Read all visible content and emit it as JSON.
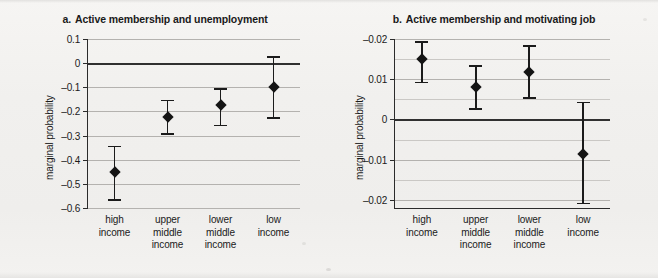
{
  "figure": {
    "background_color": "#f2f1ef",
    "marker_color": "#141414",
    "gridline_color": "#b4b2af",
    "zero_line_color": "#303030"
  },
  "panels": [
    {
      "id": "a",
      "label": "a.",
      "title": "Active membership and unemployment",
      "ylabel": "marginal probability"
    },
    {
      "id": "b",
      "label": "b.",
      "title": "Active membership and motivating job",
      "ylabel": "marginal probability"
    }
  ],
  "chart_data": [
    {
      "type": "scatter",
      "panel": "a",
      "title": "a.  Active membership and unemployment",
      "xlabel": "",
      "ylabel": "marginal probability",
      "ylim": [
        -0.6,
        0.1
      ],
      "ytick_labels": [
        "0.1",
        "0",
        "–0.1",
        "–0.2",
        "–0.3",
        "–0.4",
        "–0.5",
        "–0.6"
      ],
      "ytick_values": [
        0.1,
        0,
        -0.1,
        -0.2,
        -0.3,
        -0.4,
        -0.5,
        -0.6
      ],
      "grid": true,
      "zero_line": 0,
      "legend": "none",
      "categories": [
        "high income",
        "upper middle income",
        "lower middle income",
        "low income"
      ],
      "categories_wrapped": [
        [
          "high",
          "income"
        ],
        [
          "upper",
          "middle",
          "income"
        ],
        [
          "lower",
          "middle",
          "income"
        ],
        [
          "low",
          "income"
        ]
      ],
      "series": [
        {
          "name": "marginal probability",
          "values": [
            -0.45,
            -0.225,
            -0.175,
            -0.1
          ],
          "ci_low": [
            -0.567,
            -0.295,
            -0.258,
            -0.228
          ],
          "ci_high": [
            -0.345,
            -0.155,
            -0.108,
            0.027
          ]
        }
      ]
    },
    {
      "type": "scatter",
      "panel": "b",
      "title": "b.  Active membership and motivating job",
      "xlabel": "",
      "ylabel": "marginal probability",
      "ylim": [
        -0.022,
        0.02
      ],
      "ytick_labels": [
        "–0.02",
        "0.01",
        "0",
        "–0.01",
        "–0.02"
      ],
      "ytick_values": [
        0.02,
        0.01,
        0,
        -0.01,
        -0.02
      ],
      "minor_ytick_values": [
        0.015,
        0.005,
        -0.005,
        -0.015
      ],
      "grid": true,
      "zero_line": 0,
      "legend": "none",
      "categories": [
        "high income",
        "upper middle income",
        "lower middle income",
        "low income"
      ],
      "categories_wrapped": [
        [
          "high",
          "income"
        ],
        [
          "upper",
          "middle",
          "income"
        ],
        [
          "lower",
          "middle",
          "income"
        ],
        [
          "low",
          "income"
        ]
      ],
      "series": [
        {
          "name": "marginal probability",
          "values": [
            0.015,
            0.008,
            0.0118,
            -0.0085
          ],
          "ci_low": [
            0.0092,
            0.0026,
            0.0053,
            -0.0209
          ],
          "ci_high": [
            0.0192,
            0.0133,
            0.0183,
            0.0042
          ]
        }
      ]
    }
  ]
}
